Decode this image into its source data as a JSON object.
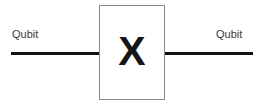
{
  "diagram": {
    "type": "quantum-circuit",
    "background_color": "#ffffff",
    "wire_color": "#111111",
    "box_border_color": "#8a8a8a",
    "label_color": "#3a3a3a",
    "gate": {
      "symbol": "X",
      "name": "pauli-x-gate"
    },
    "labels": {
      "input": "Qubit",
      "output": "Qubit"
    }
  }
}
